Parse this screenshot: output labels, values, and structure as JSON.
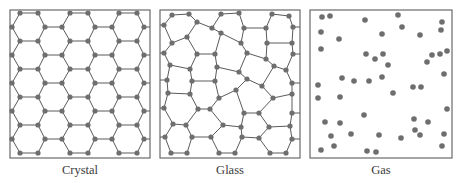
{
  "figure": {
    "panels": [
      {
        "id": "crystal",
        "label": "Crystal",
        "box": [
          10,
          10,
          150,
          158
        ]
      },
      {
        "id": "glass",
        "label": "Glass",
        "box": [
          160,
          10,
          300,
          158
        ]
      },
      {
        "id": "gas",
        "label": "Gas",
        "box": [
          310,
          10,
          452,
          158
        ]
      }
    ],
    "colors": {
      "atom": "#6e6e6e",
      "bond": "#5a5a5a",
      "border": "#6a6a6a",
      "label": "#3a3a3a"
    },
    "gas_particles": [
      [
        322,
        17
      ],
      [
        330,
        16
      ],
      [
        365,
        20
      ],
      [
        398,
        15
      ],
      [
        402,
        27
      ],
      [
        442,
        22
      ],
      [
        441,
        30
      ],
      [
        321,
        32
      ],
      [
        339,
        39
      ],
      [
        382,
        34
      ],
      [
        420,
        35
      ],
      [
        321,
        49
      ],
      [
        366,
        54
      ],
      [
        375,
        59
      ],
      [
        383,
        54
      ],
      [
        388,
        65
      ],
      [
        427,
        62
      ],
      [
        432,
        55
      ],
      [
        440,
        54
      ],
      [
        447,
        51
      ],
      [
        342,
        78
      ],
      [
        354,
        81
      ],
      [
        369,
        81
      ],
      [
        382,
        77
      ],
      [
        444,
        74
      ],
      [
        318,
        85
      ],
      [
        393,
        93
      ],
      [
        413,
        87
      ],
      [
        421,
        87
      ],
      [
        318,
        98
      ],
      [
        340,
        97
      ],
      [
        364,
        115
      ],
      [
        447,
        109
      ],
      [
        325,
        122
      ],
      [
        340,
        123
      ],
      [
        414,
        119
      ],
      [
        428,
        122
      ],
      [
        331,
        136
      ],
      [
        351,
        134
      ],
      [
        379,
        135
      ],
      [
        401,
        138
      ],
      [
        415,
        130
      ],
      [
        420,
        135
      ],
      [
        444,
        134
      ],
      [
        321,
        150
      ],
      [
        334,
        146
      ],
      [
        367,
        151
      ],
      [
        376,
        152
      ],
      [
        442,
        146
      ]
    ]
  }
}
